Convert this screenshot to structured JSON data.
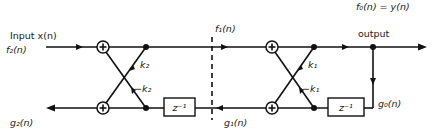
{
  "diagram": {
    "type": "two-stage lattice FIR filter",
    "labels": {
      "input": "Input x(n)",
      "f2": "f₂(n)",
      "g2": "g₂(n)",
      "f1": "f₁(n)",
      "g1": "g₁(n)",
      "f0": "f₀(n) = y(n)",
      "output": "output",
      "g0": "g₀(n)"
    },
    "stage2": {
      "k_top": "k₂",
      "k_bottom": "−k₂",
      "delay": "z⁻¹"
    },
    "stage1": {
      "k_top": "k₁",
      "k_bottom": "−k₁",
      "delay": "z⁻¹"
    },
    "adder_symbol": "+",
    "colors": {
      "line": "#111111",
      "background": "#ffffff"
    }
  }
}
